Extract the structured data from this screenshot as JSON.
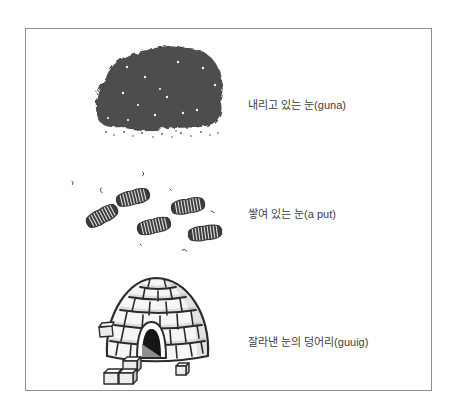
{
  "figure": {
    "type": "labeled-illustration",
    "rows": [
      {
        "illustration": "dark-falling-snow-cloud",
        "label": "내리고 있는 눈(guna)"
      },
      {
        "illustration": "snow-footprints",
        "label": "쌓여 있는 눈(a put)"
      },
      {
        "illustration": "igloo-snow-blocks",
        "label": "잘라낸 눈의 덩어리(guuig)"
      }
    ]
  },
  "colors": {
    "background": "#ffffff",
    "frame_border": "#8f8f8f",
    "snow_cloud": "#4d4d4d",
    "footprint": "#3c3c3c",
    "outline": "#2b2b2b",
    "label_text": "#3d3d3d"
  }
}
